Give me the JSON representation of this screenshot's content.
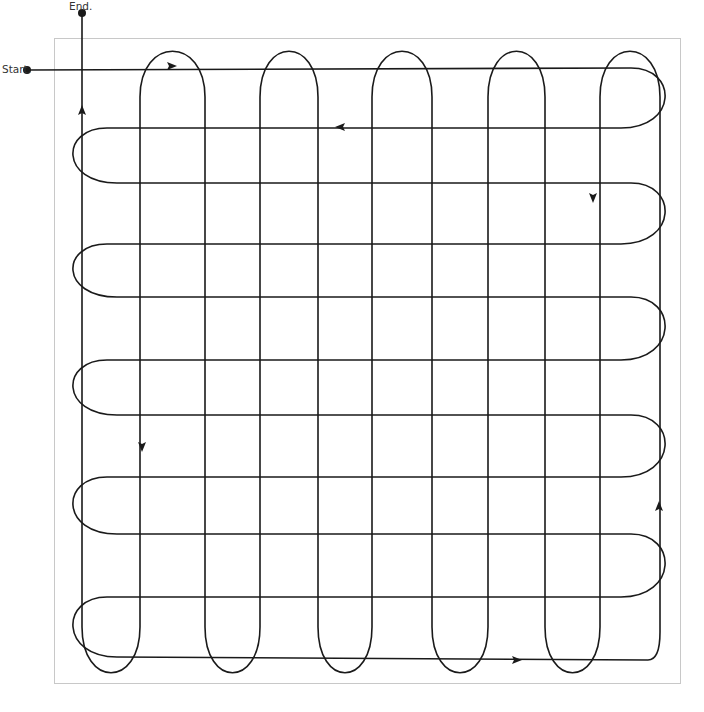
{
  "diagram": {
    "type": "continuous-path-grid",
    "frame": {
      "left": 54,
      "top": 38,
      "right": 681,
      "bottom": 684,
      "color": "#c8c8c8"
    },
    "stroke_color": "#1a1a1a",
    "labels": {
      "start": "Start.",
      "end": "End."
    },
    "points": {
      "start": {
        "x": 27,
        "y": 70
      },
      "end": {
        "x": 82,
        "y": 13
      }
    },
    "horizontal_rows_y": [
      68,
      128,
      183,
      244,
      297,
      360,
      415,
      477,
      534,
      597,
      657
    ],
    "horizontal_loop_extents": {
      "left_x": 62,
      "right_x": 676
    },
    "vertical_columns_x": [
      82,
      140,
      205,
      260,
      318,
      372,
      432,
      488,
      545,
      600,
      660
    ],
    "vertical_loop_extents": {
      "top_y": 42,
      "bottom_y": 682
    },
    "arrows": [
      {
        "name": "arrow-right-top-row",
        "x": 172,
        "y": 66,
        "dir": "right"
      },
      {
        "name": "arrow-left-second-row",
        "x": 340,
        "y": 127,
        "dir": "left"
      },
      {
        "name": "arrow-down-right-column",
        "x": 593,
        "y": 198,
        "dir": "down"
      },
      {
        "name": "arrow-down-left-column",
        "x": 142,
        "y": 447,
        "dir": "down"
      },
      {
        "name": "arrow-up-far-right-column",
        "x": 659,
        "y": 506,
        "dir": "up"
      },
      {
        "name": "arrow-right-bottom-row",
        "x": 517,
        "y": 660,
        "dir": "right"
      },
      {
        "name": "arrow-up-left-column",
        "x": 82,
        "y": 110,
        "dir": "up"
      }
    ]
  }
}
